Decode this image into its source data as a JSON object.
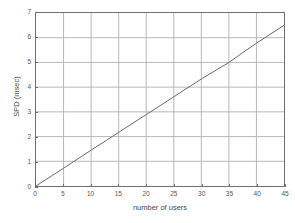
{
  "chart_data": {
    "type": "line",
    "title": "",
    "subtitle": "",
    "xlabel": "number of users",
    "ylabel": "SPD (msec)",
    "xlim": [
      0,
      45
    ],
    "ylim": [
      0,
      7
    ],
    "xticks": [
      0,
      5,
      10,
      15,
      20,
      25,
      30,
      35,
      40,
      45
    ],
    "yticks": [
      0,
      1,
      2,
      3,
      4,
      5,
      6,
      7
    ],
    "xtick_labels": [
      "0",
      "5",
      "10",
      "15",
      "20",
      "25",
      "30",
      "35",
      "40",
      "45"
    ],
    "ytick_labels": [
      "0",
      "1",
      "2",
      "3",
      "4",
      "5",
      "6",
      "7"
    ],
    "grid": true,
    "legend": null,
    "legend_position": "none",
    "annotations": [],
    "series": [
      {
        "name": "SPD",
        "color": "#6b6b6b",
        "x": [
          0,
          5,
          10,
          15,
          20,
          25,
          30,
          35,
          40,
          45
        ],
        "values": [
          0.0,
          0.72,
          1.45,
          2.17,
          2.89,
          3.61,
          4.33,
          5.0,
          5.78,
          6.5
        ]
      }
    ]
  },
  "colors": {
    "line": "#6b6b6b",
    "grid": "#b8b8b8",
    "frame": "#6e6e6e",
    "text": "#4a4a4a",
    "background": "#ffffff"
  }
}
